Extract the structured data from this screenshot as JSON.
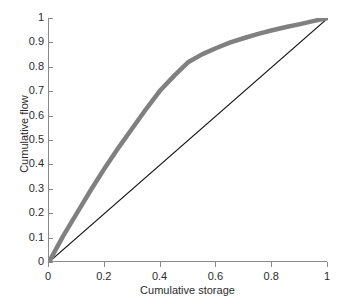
{
  "chart_data": {
    "type": "line",
    "title": "",
    "xlabel": "Cumulative storage",
    "ylabel": "Cumulative flow",
    "xlim": [
      0,
      1
    ],
    "ylim": [
      0,
      1
    ],
    "grid": false,
    "legend": "none",
    "xticks": [
      "0",
      "0.2",
      "0.4",
      "0.6",
      "0.8",
      "1"
    ],
    "xtick_values": [
      0,
      0.2,
      0.4,
      0.6,
      0.8,
      1
    ],
    "yticks": [
      "0",
      "0.1",
      "0.2",
      "0.3",
      "0.4",
      "0.5",
      "0.6",
      "0.7",
      "0.8",
      "0.9",
      "1"
    ],
    "ytick_values": [
      0,
      0.1,
      0.2,
      0.3,
      0.4,
      0.5,
      0.6,
      0.7,
      0.8,
      0.9,
      1
    ],
    "series": [
      {
        "name": "cumulative-flow-curve",
        "color": "#808080",
        "width": 4.5,
        "x": [
          0,
          0.05,
          0.1,
          0.15,
          0.2,
          0.25,
          0.3,
          0.35,
          0.4,
          0.45,
          0.5,
          0.55,
          0.6,
          0.65,
          0.7,
          0.75,
          0.8,
          0.85,
          0.9,
          0.95,
          1
        ],
        "values": [
          0,
          0.105,
          0.2,
          0.295,
          0.385,
          0.47,
          0.55,
          0.63,
          0.705,
          0.765,
          0.82,
          0.852,
          0.877,
          0.9,
          0.918,
          0.935,
          0.95,
          0.963,
          0.975,
          0.988,
          1
        ]
      },
      {
        "name": "one-to-one-line",
        "color": "#1a1a1a",
        "width": 1.2,
        "x": [
          0,
          1
        ],
        "values": [
          0,
          1
        ]
      }
    ]
  },
  "axes": {
    "x_title": "Cumulative storage",
    "y_title": "Cumulative flow"
  }
}
